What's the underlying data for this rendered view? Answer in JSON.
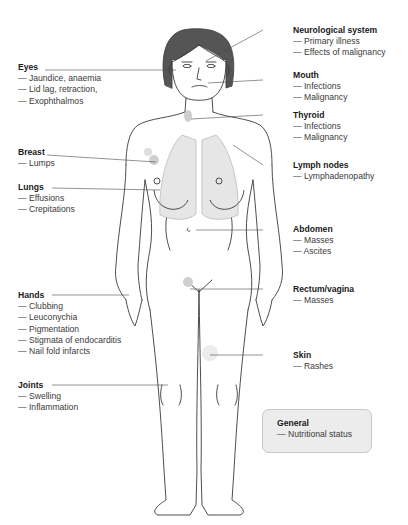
{
  "diagram": {
    "left_labels": [
      {
        "key": "eyes",
        "title": "Eyes",
        "items": [
          "Jaundice, anaemia",
          "Lid lag, retraction,",
          "Exophthalmos"
        ]
      },
      {
        "key": "breast",
        "title": "Breast",
        "items": [
          "Lumps"
        ]
      },
      {
        "key": "lungs",
        "title": "Lungs",
        "items": [
          "Effusions",
          "Crepitations"
        ]
      },
      {
        "key": "hands",
        "title": "Hands",
        "items": [
          "Clubbing",
          "Leuconychia",
          "Pigmentation",
          "Stigmata of endocarditis",
          "Nail fold infarcts"
        ]
      },
      {
        "key": "joints",
        "title": "Joints",
        "items": [
          "Swelling",
          "Inflammation"
        ]
      }
    ],
    "right_labels": [
      {
        "key": "neurological",
        "title": "Neurological system",
        "items": [
          "Primary illness",
          "Effects of malignancy"
        ]
      },
      {
        "key": "mouth",
        "title": "Mouth",
        "items": [
          "Infections",
          "Malignancy"
        ]
      },
      {
        "key": "thyroid",
        "title": "Thyroid",
        "items": [
          "Infections",
          "Malignancy"
        ]
      },
      {
        "key": "lymph",
        "title": "Lymph nodes",
        "items": [
          "Lymphadenopathy"
        ]
      },
      {
        "key": "abdomen",
        "title": "Abdomen",
        "items": [
          "Masses",
          "Ascites"
        ]
      },
      {
        "key": "rectum",
        "title": "Rectum/vagina",
        "items": [
          "Masses"
        ]
      },
      {
        "key": "skin",
        "title": "Skin",
        "items": [
          "Rashes"
        ]
      }
    ],
    "general_box": {
      "title": "General",
      "items": [
        "Nutritional status"
      ]
    },
    "colors": {
      "line": "#3a3a3a",
      "lungs_fill": "#e6e6e6",
      "hair": "#555555",
      "highlight": "#cfcfcf",
      "box_bg": "#ececec"
    }
  }
}
